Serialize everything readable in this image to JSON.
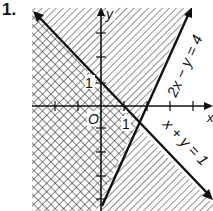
{
  "problem": {
    "number": "1."
  },
  "axes": {
    "x_label": "x",
    "y_label": "y",
    "origin_label": "O",
    "x_one_label": "1",
    "y_one_label": "1"
  },
  "lines": [
    {
      "id": "line-1",
      "equation": "x + y = 1",
      "label": "x + y = 1"
    },
    {
      "id": "line-2",
      "equation": "2x − y = 4",
      "label": "2x − y = 4"
    }
  ],
  "colors": {
    "ink": "#111111",
    "background": "#ffffff"
  }
}
